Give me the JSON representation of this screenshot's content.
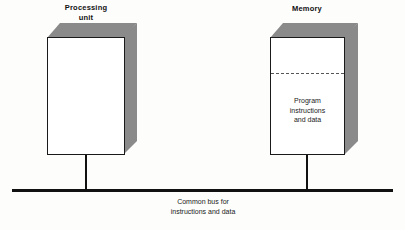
{
  "diagram": {
    "background_color": "#fdfdfc",
    "line_color": "#111111",
    "box_face_color": "#ffffff",
    "box_shade_color": "#8a8a8a",
    "partition_color": "#55555a",
    "nodes": [
      {
        "id": "processing-unit",
        "label": "Processing\nunit",
        "label_bold": true
      },
      {
        "id": "memory",
        "label": "Memory",
        "label_bold": true,
        "contents_text": "Program\ninstructions\nand data",
        "has_dashed_partition": true
      }
    ],
    "bus": {
      "caption": "Common bus for\ninstructions and data"
    }
  }
}
